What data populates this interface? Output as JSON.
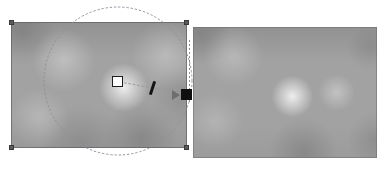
{
  "view": {
    "title": "Image selection comparison view",
    "background_color": "#ffffff",
    "width": 383,
    "height": 169
  },
  "left_panel": {
    "name": "source-image",
    "label": "Source image with selection overlay",
    "frame": {
      "x": 11,
      "y": 22,
      "width": 176,
      "height": 126
    },
    "fill_color": "#a2a2a2",
    "border_color": "#5a5a5a",
    "handles": [
      {
        "id": "top-left",
        "x": 9,
        "y": 20,
        "color": "#5b5b5b"
      },
      {
        "id": "top-right",
        "x": 184,
        "y": 20,
        "color": "#5b5b5b"
      },
      {
        "id": "bottom-left",
        "x": 9,
        "y": 145,
        "color": "#5b5b5b"
      },
      {
        "id": "bottom-right",
        "x": 184,
        "y": 145,
        "color": "#5b5b5b"
      }
    ]
  },
  "right_panel": {
    "name": "result-image",
    "label": "Result image preview",
    "frame": {
      "x": 193,
      "y": 27,
      "width": 184,
      "height": 131
    },
    "fill_color": "#a2a2a2",
    "border_color": "#6e6e6e"
  },
  "overlay": {
    "selection_circle": {
      "name": "selection-circle",
      "center_x": 118,
      "center_y": 81,
      "radius": 74,
      "stroke_color": "#8f8f9c",
      "style": "dotted"
    },
    "radius_line": {
      "name": "radius-line",
      "from_x": 120,
      "from_y": 82,
      "to_x": 190,
      "to_y": 95,
      "stroke_color": "#9a9aa4",
      "style": "dashed"
    },
    "center_marker": {
      "name": "center-marker",
      "x": 112,
      "y": 76,
      "size": 11,
      "fill_color": "#fdfdfd",
      "stroke_color": "#1d1d1d"
    },
    "angle_tick": {
      "name": "angle-tick",
      "x": 151,
      "y": 81,
      "rotation_deg": 18,
      "color": "#141414"
    },
    "drag_arrow": {
      "name": "drag-arrow",
      "x": 172,
      "y": 90,
      "color": "#6e6e6e",
      "direction": "right"
    },
    "edge_node": {
      "name": "edge-node",
      "x": 181,
      "y": 89,
      "size": 11,
      "color": "#101010"
    },
    "gutter_rule": {
      "name": "gutter-dashed-rule",
      "x": 189,
      "y": 40,
      "height": 62,
      "color": "#8a8a8a"
    }
  }
}
